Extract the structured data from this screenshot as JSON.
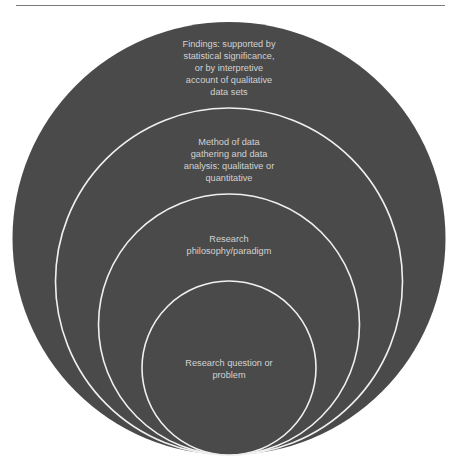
{
  "header": {
    "clipped_text": ""
  },
  "diagram": {
    "type": "nested-circles",
    "colors": {
      "fill": "#4a4a4a",
      "stroke": "#f0f0f0",
      "text": "#d2d2d2"
    },
    "layers": [
      {
        "level": 4,
        "label": "Findings: supported by statistical significance, or by interpretive account of qualitative data sets",
        "lines": [
          "Findings: supported by",
          "statistical significance,",
          "or by interpretive",
          "account of qualitative",
          "data sets"
        ]
      },
      {
        "level": 3,
        "label": "Method of data gathering and data analysis: qualitative or quantitative",
        "lines": [
          "Method of data",
          "gathering and data",
          "analysis: qualitative or",
          "quantitative"
        ]
      },
      {
        "level": 2,
        "label": "Research philosophy/paradigm",
        "lines": [
          "Research",
          "philosophy/paradigm"
        ]
      },
      {
        "level": 1,
        "label": "Research question or problem",
        "lines": [
          "Research question or",
          "problem"
        ]
      }
    ]
  }
}
